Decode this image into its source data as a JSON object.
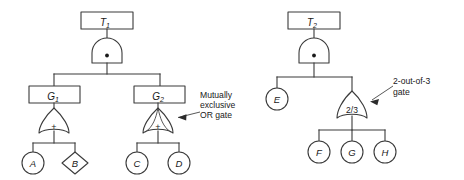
{
  "figure": {
    "background_color": "#ffffff",
    "line_color": "#3a3a3a",
    "text_color": "#1a1a1a"
  },
  "trees": [
    {
      "id": "left-fault-tree",
      "top_event": {
        "label": "T",
        "subscript": "1",
        "shape": "rectangle"
      },
      "top_gate": {
        "type": "and-gate",
        "symbol": "•"
      },
      "intermediate_events": [
        {
          "label": "G",
          "subscript": "1",
          "shape": "rectangle"
        },
        {
          "label": "G",
          "subscript": "2",
          "shape": "rectangle"
        }
      ],
      "gates": [
        {
          "type": "or-gate",
          "symbol": "+",
          "parent": "G1"
        },
        {
          "type": "mutually-exclusive-or-gate",
          "symbol": "+",
          "parent": "G2"
        }
      ],
      "basic_events": [
        {
          "label": "A",
          "shape": "circle"
        },
        {
          "label": "B",
          "shape": "diamond"
        },
        {
          "label": "C",
          "shape": "circle"
        },
        {
          "label": "D",
          "shape": "circle"
        }
      ]
    },
    {
      "id": "right-fault-tree",
      "top_event": {
        "label": "T",
        "subscript": "2",
        "shape": "rectangle"
      },
      "top_gate": {
        "type": "and-gate",
        "symbol": "•"
      },
      "gates": [
        {
          "type": "voting-gate",
          "symbol": "2/3"
        }
      ],
      "basic_events": [
        {
          "label": "E",
          "shape": "circle"
        },
        {
          "label": "F",
          "shape": "circle"
        },
        {
          "label": "G",
          "shape": "circle"
        },
        {
          "label": "H",
          "shape": "circle"
        }
      ]
    }
  ],
  "annotations": {
    "mutually_exclusive": {
      "lines": [
        "Mutually",
        "exclusive",
        "OR gate"
      ],
      "line1": "Mutually",
      "line2": "exclusive",
      "line3": "OR gate"
    },
    "two_out_of_three": {
      "lines": [
        "2-out-of-3",
        "gate"
      ],
      "line1": "2-out-of-3",
      "line2": "gate"
    }
  }
}
